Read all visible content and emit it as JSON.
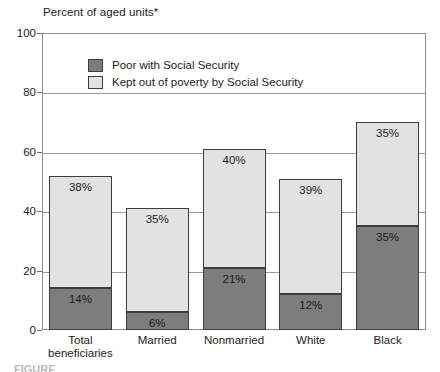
{
  "figure": {
    "y_axis_caption": "Percent of aged units*",
    "caption_partial": "FIGURE"
  },
  "legend": {
    "position": "inside-top-left",
    "items": [
      {
        "label": "Poor with Social Security",
        "swatch": "dark",
        "color": "#7d7d7d"
      },
      {
        "label": "Kept out of poverty by Social Security",
        "swatch": "light",
        "color": "#e2e2e2"
      }
    ]
  },
  "chart_data": {
    "type": "bar",
    "stacked": true,
    "title": "",
    "subtitle": "",
    "xlabel": "",
    "ylabel": "Percent of aged units*",
    "ylim": [
      0,
      100
    ],
    "yticks": [
      0,
      20,
      40,
      60,
      80,
      100
    ],
    "ytick_labels": [
      "0",
      "20",
      "40",
      "60",
      "80",
      "100"
    ],
    "grid": "horizontal",
    "categories": [
      "Total beneficiaries",
      "Married",
      "Nonmarried",
      "White",
      "Black"
    ],
    "category_lines": [
      [
        "Total",
        "beneficiaries"
      ],
      [
        "Married"
      ],
      [
        "Nonmarried"
      ],
      [
        "White"
      ],
      [
        "Black"
      ]
    ],
    "series": [
      {
        "name": "Poor with Social Security",
        "color": "#7d7d7d",
        "values": [
          14,
          6,
          21,
          12,
          35
        ],
        "labels": [
          "14%",
          "6%",
          "21%",
          "12%",
          "35%"
        ]
      },
      {
        "name": "Kept out of poverty by Social Security",
        "color": "#e2e2e2",
        "values": [
          38,
          35,
          40,
          39,
          35
        ],
        "labels": [
          "38%",
          "35%",
          "40%",
          "39%",
          "35%"
        ]
      }
    ],
    "totals": [
      52,
      41,
      61,
      51,
      70
    ]
  }
}
